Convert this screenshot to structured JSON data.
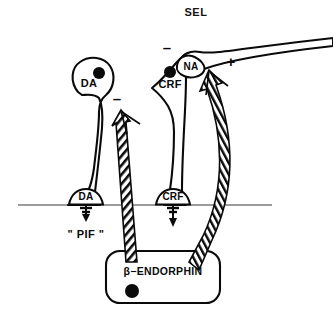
{
  "figure": {
    "title": "SEL",
    "background_color": "#ffffff",
    "ink_color": "#0a0a0a",
    "portal_line_color": "#3a3a3a"
  },
  "neurons": [
    {
      "id": "da",
      "soma_label": "DA",
      "terminal_label": "DA",
      "soma_shape": "oval",
      "nucleus": "filled-dot",
      "modulation_sign": "–",
      "secretion_label": "\" PIF \""
    },
    {
      "id": "crf",
      "soma_label": "CRF",
      "terminal_label": "CRF",
      "soma_shape": "diamond",
      "nucleus": "filled-dot",
      "modulation_sign": "–",
      "secretion_label": ""
    }
  ],
  "afferent": {
    "id": "na",
    "label": "NA",
    "modulation_sign": "+",
    "description": "noradrenergic-axon-terminal"
  },
  "source_box": {
    "label": "β−ENDORPHIN",
    "nucleus": "filled-dot"
  },
  "signs": {
    "minus_on_da": "–",
    "minus_on_crf": "–",
    "plus_on_na": "+"
  },
  "labels": {
    "title": "SEL",
    "da_soma": "DA",
    "da_terminal": "DA",
    "crf_soma": "CRF",
    "crf_terminal": "CRF",
    "na_terminal": "NA",
    "pif": "\" PIF \"",
    "beta_endorphin": "β−ENDORPHIN"
  }
}
